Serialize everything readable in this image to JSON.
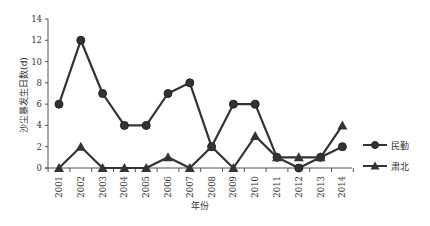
{
  "chart_data": {
    "type": "line",
    "title": "",
    "xlabel": "年份",
    "ylabel": "沙尘暴发生日数(d)",
    "ylim": [
      0,
      14
    ],
    "yticks": [
      0,
      2,
      4,
      6,
      8,
      10,
      12,
      14
    ],
    "x": [
      "2001",
      "2002",
      "2003",
      "2004",
      "2005",
      "2006",
      "2007",
      "2008",
      "2009",
      "2010",
      "2011",
      "2012",
      "2013",
      "2014"
    ],
    "grid": false,
    "legend_position": "right",
    "series": [
      {
        "name": "民勤",
        "marker": "circle",
        "color": "#333333",
        "values": [
          6,
          12,
          7,
          4,
          4,
          7,
          8,
          2,
          6,
          6,
          1,
          0,
          1,
          2
        ]
      },
      {
        "name": "肃北",
        "marker": "triangle",
        "color": "#333333",
        "values": [
          0,
          2,
          0,
          0,
          0,
          1,
          0,
          2,
          0,
          3,
          1,
          1,
          1,
          4
        ]
      }
    ]
  }
}
